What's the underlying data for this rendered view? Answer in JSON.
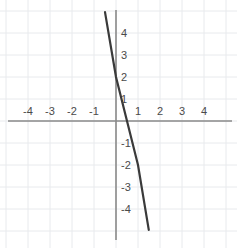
{
  "figure": {
    "background_color": "#ffffff",
    "grid_color": "#e8eaed",
    "axis_color": "#8a8a8a",
    "line_color": "#3a3a3a",
    "label_color": "#4a4a4a"
  },
  "chart_data": {
    "type": "line",
    "title": "",
    "xlabel": "",
    "ylabel": "",
    "xlim": [
      -5.25,
      5.5
    ],
    "ylim": [
      -5.4,
      5.4
    ],
    "grid": true,
    "grid_step": 1,
    "legend": "none",
    "axes": {
      "x_ticks": [
        -4,
        -3,
        -2,
        -1,
        1,
        2,
        3,
        4
      ],
      "x_tick_labels": [
        "-4",
        "-3",
        "-2",
        "-1",
        "1",
        "2",
        "3",
        "4"
      ],
      "y_ticks": [
        4,
        3,
        2,
        1,
        -1,
        -2,
        -3,
        -4
      ],
      "y_tick_labels": [
        "4",
        "3",
        "2",
        "1",
        "-1",
        "-2",
        "-3",
        "-4"
      ],
      "origin_label": ""
    },
    "series": [
      {
        "name": "line",
        "equation": "y = -4x + 2",
        "slope": -4,
        "intercept": 2,
        "x_intercept": 0.5,
        "points": [
          {
            "x": -0.5,
            "y": 4.95
          },
          {
            "x": 0,
            "y": 2
          },
          {
            "x": 0.5,
            "y": 0
          },
          {
            "x": 1,
            "y": -2
          },
          {
            "x": 1.49,
            "y": -4.95
          }
        ]
      }
    ]
  }
}
